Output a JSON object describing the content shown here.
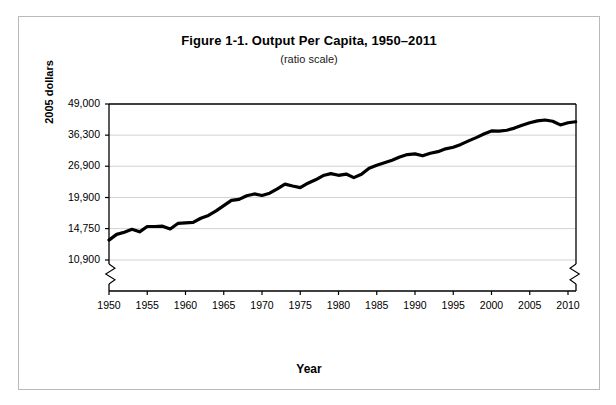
{
  "figure": {
    "title": "Figure 1-1. Output Per Capita, 1950–2011",
    "subtitle": "(ratio scale)"
  },
  "chart_data": {
    "type": "line",
    "title": "Figure 1-1. Output Per Capita, 1950–2011",
    "subtitle": "(ratio scale)",
    "xlabel": "Year",
    "ylabel": "2005 dollars",
    "scale": "log",
    "grid": true,
    "legend": false,
    "axis_break": {
      "left": true,
      "right": true,
      "note": "zigzag break below lowest tick on both vertical axes"
    },
    "ylim": [
      10900,
      49000
    ],
    "ytick_labels": [
      "49,000",
      "36,300",
      "26,900",
      "19,900",
      "14,750",
      "10,900"
    ],
    "ytick_values": [
      49000,
      36300,
      26900,
      19900,
      14750,
      10900
    ],
    "xlim": [
      1950,
      2011
    ],
    "xtick_labels": [
      "1950",
      "1955",
      "1960",
      "1965",
      "1970",
      "1975",
      "1980",
      "1985",
      "1990",
      "1995",
      "2000",
      "2005",
      "2010"
    ],
    "xtick_values": [
      1950,
      1955,
      1960,
      1965,
      1970,
      1975,
      1980,
      1985,
      1990,
      1995,
      2000,
      2005,
      2010
    ],
    "series": [
      {
        "name": "Output per capita",
        "color": "#000000",
        "line_width": 3.2,
        "x": [
          1950,
          1951,
          1952,
          1953,
          1954,
          1955,
          1956,
          1957,
          1958,
          1959,
          1960,
          1961,
          1962,
          1963,
          1964,
          1965,
          1966,
          1967,
          1968,
          1969,
          1970,
          1971,
          1972,
          1973,
          1974,
          1975,
          1976,
          1977,
          1978,
          1979,
          1980,
          1981,
          1982,
          1983,
          1984,
          1985,
          1986,
          1987,
          1988,
          1989,
          1990,
          1991,
          1992,
          1993,
          1994,
          1995,
          1996,
          1997,
          1998,
          1999,
          2000,
          2001,
          2002,
          2003,
          2004,
          2005,
          2006,
          2007,
          2008,
          2009,
          2010,
          2011
        ],
        "values": [
          13200,
          13950,
          14250,
          14650,
          14300,
          15050,
          15050,
          15100,
          14700,
          15500,
          15600,
          15650,
          16300,
          16750,
          17500,
          18400,
          19350,
          19550,
          20250,
          20600,
          20300,
          20750,
          21650,
          22650,
          22250,
          21900,
          22850,
          23600,
          24600,
          25050,
          24650,
          24950,
          24100,
          24900,
          26400,
          27150,
          27800,
          28500,
          29400,
          30100,
          30300,
          29750,
          30500,
          30950,
          31800,
          32300,
          33200,
          34350,
          35450,
          36700,
          37800,
          37700,
          38050,
          38850,
          39950,
          40900,
          41650,
          42000,
          41500,
          40050,
          40900,
          41300
        ]
      }
    ]
  },
  "axis": {
    "y_title": "2005 dollars",
    "x_title": "Year"
  }
}
